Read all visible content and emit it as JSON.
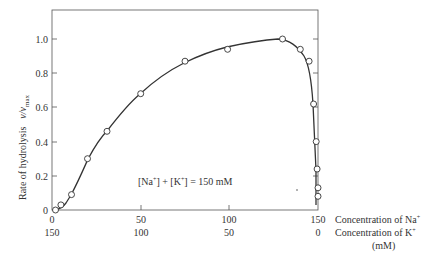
{
  "chart_data": {
    "type": "line",
    "title": "",
    "xlabel": "Concentration of Na+ / Concentration of K+ (mM)",
    "ylabel": "Rate of hydrolysis v/vmax",
    "xlim": [
      0,
      150
    ],
    "ylim": [
      0,
      1.17
    ],
    "grid": false,
    "legend": null,
    "x_ticks_na": [
      "0",
      "50",
      "100",
      "150"
    ],
    "x_ticks_k": [
      "150",
      "100",
      "50",
      "0"
    ],
    "y_ticks": [
      "0",
      "0.2",
      "0.4",
      "0.6",
      "0.8",
      "1.0"
    ],
    "annotation": "[Na+] + [K+] = 150 mM",
    "series": [
      {
        "name": "Measured rate",
        "x": [
          2,
          5,
          11,
          20,
          31,
          50,
          75,
          99,
          130,
          140,
          145,
          147.5,
          149,
          149.5,
          150,
          150
        ],
        "values": [
          0.0,
          0.03,
          0.09,
          0.3,
          0.46,
          0.68,
          0.87,
          0.94,
          1.0,
          0.94,
          0.87,
          0.62,
          0.4,
          0.24,
          0.13,
          0.08
        ]
      }
    ]
  },
  "axes": {
    "y_label_main": "Rate of hydrolysis",
    "y_label_var": "v/v",
    "y_label_sub": "max",
    "x_label_na": "Concentration of Na",
    "x_label_k": "Concentration of K",
    "x_label_units": "(mM)",
    "sup_plus": "+"
  },
  "annotation": {
    "na_open": "[Na",
    "na_close": "] + [K",
    "k_close": "] = 150 mM",
    "plus": "+"
  }
}
